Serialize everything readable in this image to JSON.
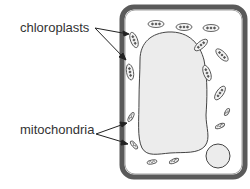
{
  "diagram": {
    "labels": {
      "chloroplasts": "chloroplasts",
      "mitochondria": "mitochondria"
    },
    "colors": {
      "cell_wall": "#5a5a5a",
      "cytoplasm": "#ffffff",
      "vacuole_fill": "#ececec",
      "outline": "#444444",
      "label_text": "#333333"
    },
    "structures": [
      "cell wall",
      "cell membrane",
      "central vacuole",
      "nucleus",
      "chloroplasts",
      "mitochondria"
    ]
  }
}
